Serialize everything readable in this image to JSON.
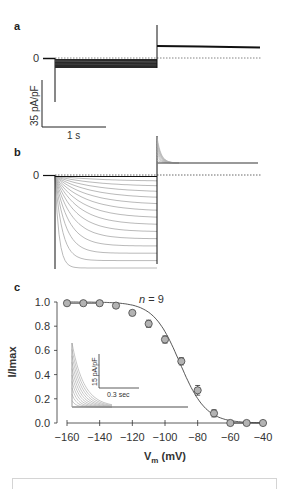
{
  "panels": {
    "a": {
      "label": "a",
      "zero_label": "0",
      "scalebar_y_label": "35 pA/pF",
      "scalebar_x_label": "1 s"
    },
    "b": {
      "label": "b",
      "zero_label": "0",
      "trace_count": 14
    },
    "c": {
      "label": "c",
      "n_label": "n = 9",
      "inset": {
        "scalebar_y_label": "15 pA/pF",
        "scalebar_x_label": "0.3 sec"
      }
    }
  },
  "chart_data": {
    "type": "scatter",
    "title": "",
    "xlabel": "Vm (mV)",
    "ylabel": "I/Imax",
    "x": [
      -160,
      -150,
      -140,
      -130,
      -120,
      -110,
      -100,
      -90,
      -80,
      -70,
      -60,
      -50,
      -40
    ],
    "series": [
      {
        "name": "I/Imax (mean ± SEM, n = 9)",
        "values": [
          0.99,
          0.99,
          0.99,
          0.97,
          0.91,
          0.82,
          0.69,
          0.51,
          0.27,
          0.08,
          0.0,
          0.0,
          0.0
        ],
        "errors": [
          0.0,
          0.0,
          0.0,
          0.0,
          0.0,
          0.03,
          0.03,
          0.03,
          0.04,
          0.03,
          0.0,
          0.0,
          0.0
        ]
      },
      {
        "name": "Boltzmann fit",
        "type": "line",
        "v_half": -91,
        "slope": 8
      }
    ],
    "xlim": [
      -160,
      -40
    ],
    "ylim": [
      0.0,
      1.0
    ],
    "xticks": [
      "-160",
      "-140",
      "-120",
      "-100",
      "-80",
      "-60",
      "-40"
    ],
    "yticks": [
      "0.0",
      "0.2",
      "0.4",
      "0.6",
      "0.8",
      "1.0"
    ],
    "grid": false,
    "legend": "none",
    "annotations": [
      "n = 9"
    ]
  }
}
